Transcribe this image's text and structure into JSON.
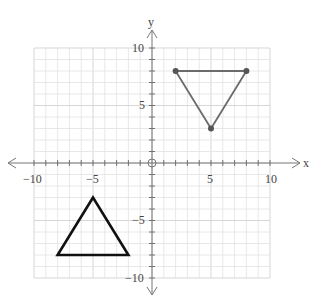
{
  "graph": {
    "x_axis_label": "x",
    "y_axis_label": "y",
    "x_tick_labels": [
      "−10",
      "−5",
      "5",
      "10"
    ],
    "y_tick_labels": [
      "10",
      "5",
      "−5",
      "−10"
    ],
    "range": {
      "xmin": -10,
      "xmax": 10,
      "ymin": -10,
      "ymax": 10
    },
    "grid_step": 1
  },
  "shapes": {
    "black_triangle": {
      "vertices": [
        [
          -5,
          -3
        ],
        [
          -8,
          -8
        ],
        [
          -2,
          -8
        ]
      ],
      "color": "#111111"
    },
    "gray_triangle": {
      "vertices": [
        [
          2,
          8
        ],
        [
          8,
          8
        ],
        [
          5,
          3
        ]
      ],
      "color": "#6b6b6b",
      "hand_drawn": true
    }
  }
}
